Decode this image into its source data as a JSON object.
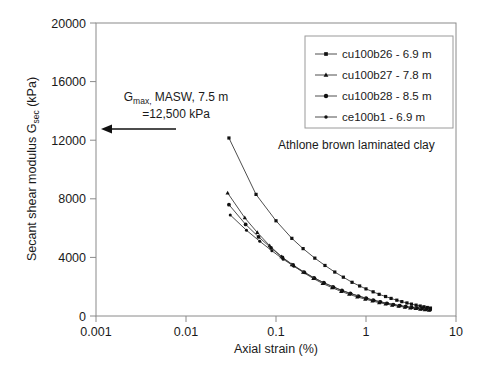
{
  "chart_data": {
    "type": "line",
    "title": "",
    "xlabel": "Axial strain (%)",
    "ylabel": "Secant shear modulus G_sec (kPa)",
    "ylabel_main": "Secant shear modulus G",
    "ylabel_sub": "sec",
    "ylabel_unit": " (kPa)",
    "xscale": "log",
    "yscale": "linear",
    "xlim": [
      0.001,
      10
    ],
    "ylim": [
      0,
      20000
    ],
    "xticks": [
      0.001,
      0.01,
      0.1,
      1,
      10
    ],
    "xticklabels": [
      "0.001",
      "0.01",
      "0.1",
      "1",
      "10"
    ],
    "yticks": [
      0,
      4000,
      8000,
      12000,
      16000,
      20000
    ],
    "yticklabels": [
      "0",
      "4000",
      "8000",
      "12000",
      "16000",
      "20000"
    ],
    "grid": false,
    "legend_position": "upper right",
    "series": [
      {
        "name": "cu100b26 - 6.9 m",
        "marker": "square",
        "points": [
          [
            0.03,
            12150
          ],
          [
            0.06,
            8300
          ],
          [
            0.1,
            6500
          ],
          [
            0.15,
            5300
          ],
          [
            0.2,
            4600
          ],
          [
            0.27,
            3950
          ],
          [
            0.35,
            3450
          ],
          [
            0.45,
            3000
          ],
          [
            0.56,
            2650
          ],
          [
            0.7,
            2300
          ],
          [
            0.85,
            2050
          ],
          [
            1.0,
            1850
          ],
          [
            1.2,
            1650
          ],
          [
            1.4,
            1480
          ],
          [
            1.65,
            1330
          ],
          [
            1.9,
            1200
          ],
          [
            2.2,
            1080
          ],
          [
            2.5,
            980
          ],
          [
            2.85,
            890
          ],
          [
            3.2,
            810
          ],
          [
            3.6,
            740
          ],
          [
            4.0,
            680
          ],
          [
            4.4,
            630
          ],
          [
            4.8,
            580
          ],
          [
            5.2,
            540
          ]
        ]
      },
      {
        "name": "cu100b27 - 7.8 m",
        "marker": "triangle",
        "points": [
          [
            0.029,
            8400
          ],
          [
            0.045,
            6700
          ],
          [
            0.062,
            5700
          ],
          [
            0.085,
            4800
          ],
          [
            0.115,
            4050
          ],
          [
            0.15,
            3500
          ],
          [
            0.2,
            2980
          ],
          [
            0.26,
            2560
          ],
          [
            0.33,
            2220
          ],
          [
            0.42,
            1930
          ],
          [
            0.53,
            1680
          ],
          [
            0.65,
            1480
          ],
          [
            0.8,
            1300
          ],
          [
            0.98,
            1150
          ],
          [
            1.18,
            1020
          ],
          [
            1.4,
            910
          ],
          [
            1.65,
            820
          ],
          [
            1.95,
            740
          ],
          [
            2.3,
            665
          ],
          [
            2.7,
            600
          ],
          [
            3.1,
            550
          ],
          [
            3.55,
            505
          ],
          [
            4.0,
            465
          ],
          [
            4.5,
            430
          ],
          [
            5.0,
            400
          ]
        ]
      },
      {
        "name": "cu100b28 - 8.5 m",
        "marker": "circle",
        "points": [
          [
            0.03,
            7600
          ],
          [
            0.046,
            6250
          ],
          [
            0.064,
            5400
          ],
          [
            0.088,
            4650
          ],
          [
            0.118,
            4000
          ],
          [
            0.155,
            3480
          ],
          [
            0.205,
            3000
          ],
          [
            0.265,
            2600
          ],
          [
            0.34,
            2270
          ],
          [
            0.43,
            1990
          ],
          [
            0.54,
            1740
          ],
          [
            0.67,
            1540
          ],
          [
            0.82,
            1360
          ],
          [
            1.0,
            1210
          ],
          [
            1.2,
            1080
          ],
          [
            1.43,
            965
          ],
          [
            1.7,
            865
          ],
          [
            2.0,
            780
          ],
          [
            2.35,
            705
          ],
          [
            2.75,
            640
          ],
          [
            3.2,
            585
          ],
          [
            3.65,
            540
          ],
          [
            4.15,
            500
          ],
          [
            4.65,
            465
          ],
          [
            5.15,
            435
          ]
        ]
      },
      {
        "name": "ce100b1 - 6.9 m",
        "marker": "dot",
        "points": [
          [
            0.031,
            6900
          ],
          [
            0.047,
            5850
          ],
          [
            0.066,
            5100
          ],
          [
            0.09,
            4450
          ],
          [
            0.12,
            3880
          ],
          [
            0.158,
            3400
          ],
          [
            0.21,
            2950
          ],
          [
            0.27,
            2570
          ],
          [
            0.345,
            2250
          ],
          [
            0.44,
            1970
          ],
          [
            0.55,
            1730
          ],
          [
            0.68,
            1530
          ],
          [
            0.84,
            1355
          ],
          [
            1.02,
            1205
          ],
          [
            1.23,
            1075
          ],
          [
            1.46,
            965
          ],
          [
            1.73,
            870
          ],
          [
            2.04,
            785
          ],
          [
            2.4,
            710
          ],
          [
            2.8,
            645
          ],
          [
            3.25,
            590
          ],
          [
            3.72,
            545
          ],
          [
            4.22,
            505
          ],
          [
            4.72,
            470
          ],
          [
            5.2,
            440
          ]
        ]
      }
    ],
    "annotations": [
      {
        "name": "gmax-annotation",
        "line1": "G",
        "line1_sub": "max,",
        "line1_rest": " MASW, 7.5 m",
        "line2": "=12,500  kPa",
        "arrow": "left-arrow",
        "arrow_value_kpa": 12500
      },
      {
        "name": "material-label",
        "text": "Athlone brown laminated clay"
      }
    ]
  }
}
